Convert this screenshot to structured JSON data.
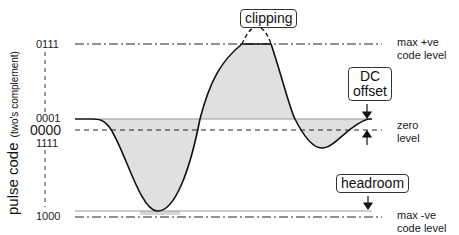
{
  "axis": {
    "ylabel_main": "pulse code",
    "ylabel_sub": "(two's complement)"
  },
  "codes": {
    "max_pos": "0111",
    "one": "0001",
    "zero": "0000",
    "minus_one": "1111",
    "max_neg": "1000"
  },
  "levels": {
    "max_pos_line1": "max +ve",
    "max_pos_line2": "code level",
    "zero_line1": "zero",
    "zero_line2": "level",
    "max_neg_line1": "max -ve",
    "max_neg_line2": "code level"
  },
  "callouts": {
    "clipping": "clipping",
    "dc_offset_line1": "DC",
    "dc_offset_line2": "offset",
    "headroom": "headroom"
  },
  "colors": {
    "fill": "#e0e0e0",
    "stroke": "#111111",
    "guide": "#222222"
  },
  "geometry": {
    "y_max_pos": 44,
    "y_one": 119,
    "y_zero": 130,
    "y_minus_one": 143,
    "y_max_neg": 217,
    "clip_start_x": 242,
    "clip_end_x": 271,
    "trough_x": 157,
    "trough_y": 211
  }
}
